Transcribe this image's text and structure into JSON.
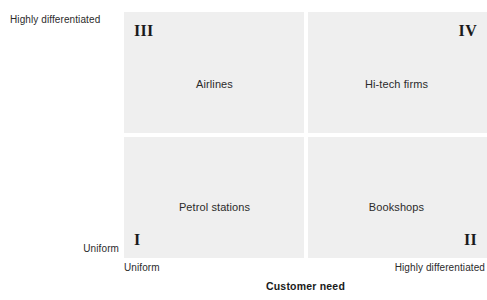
{
  "chart_data": {
    "type": "table",
    "title": "",
    "xlabel": "Customer need",
    "ylabel": "Customer valuations",
    "x_ticks": [
      "Uniform",
      "Highly differentiated"
    ],
    "y_ticks": [
      "Uniform",
      "Highly differentiated"
    ],
    "grid": false,
    "legend": "none",
    "quadrants": [
      {
        "numeral": "III",
        "label": "Airlines",
        "x": "Uniform",
        "y": "Highly differentiated",
        "position": "top-left"
      },
      {
        "numeral": "IV",
        "label": "Hi-tech firms",
        "x": "Highly differentiated",
        "y": "Highly differentiated",
        "position": "top-right"
      },
      {
        "numeral": "I",
        "label": "Petrol stations",
        "x": "Uniform",
        "y": "Uniform",
        "position": "bottom-left"
      },
      {
        "numeral": "II",
        "label": "Bookshops",
        "x": "Highly differentiated",
        "y": "Uniform",
        "position": "bottom-right"
      }
    ],
    "colors": {
      "background": "#ffffff",
      "cell_fill": "#efefef",
      "divider": "#ffffff",
      "text": "#231f20"
    }
  },
  "axes": {
    "y": {
      "title": "Customer valuations",
      "top_label": "Highly differentiated",
      "bottom_label": "Uniform"
    },
    "x": {
      "title": "Customer need",
      "left_label": "Uniform",
      "right_label": "Highly differentiated"
    }
  },
  "matrix": {
    "top_left": {
      "numeral": "III",
      "label": "Airlines"
    },
    "top_right": {
      "numeral": "IV",
      "label": "Hi-tech firms"
    },
    "bottom_left": {
      "numeral": "I",
      "label": "Petrol stations"
    },
    "bottom_right": {
      "numeral": "II",
      "label": "Bookshops"
    }
  }
}
